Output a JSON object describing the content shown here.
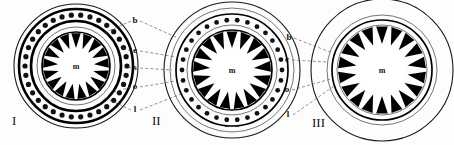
{
  "figure": {
    "background_color": "#fdfdfd",
    "ink_color": "#000000",
    "leader_color": "#4a4a52",
    "center_label": "m",
    "panels": [
      {
        "id": "panel-1",
        "roman": "I",
        "cx": 76,
        "cy": 66,
        "center_label": "m",
        "rings": [
          {
            "name": "b",
            "r": 62,
            "style": "thin"
          },
          {
            "name": "b-inner",
            "r": 57,
            "style": "fat"
          },
          {
            "name": "e",
            "r": 51,
            "style": "beaded"
          },
          {
            "name": "s",
            "r": 45,
            "style": "fat"
          },
          {
            "name": "o",
            "r": 39,
            "style": "hair"
          },
          {
            "name": "l",
            "r": 34,
            "style": "teeth"
          }
        ],
        "teeth_count": 17,
        "beads_count": 34
      },
      {
        "id": "panel-2",
        "roman": "II",
        "cx": 232,
        "cy": 70,
        "center_label": "m",
        "rings": [
          {
            "name": "b",
            "r": 68,
            "style": "thin"
          },
          {
            "name": "b-inner",
            "r": 62,
            "style": "hair"
          },
          {
            "name": "e",
            "r": 56,
            "style": "mid"
          },
          {
            "name": "s",
            "r": 50,
            "style": "beaded"
          },
          {
            "name": "o",
            "r": 45,
            "style": "hair"
          },
          {
            "name": "l",
            "r": 40,
            "style": "teeth"
          }
        ],
        "teeth_count": 17,
        "beads_count": 30
      },
      {
        "id": "panel-3",
        "roman": "III",
        "cx": 382,
        "cy": 70,
        "center_label": "m",
        "rings": [
          {
            "name": "b",
            "r": 71,
            "style": "thin"
          },
          {
            "name": "e",
            "r": 55,
            "style": "hair"
          },
          {
            "name": "o",
            "r": 50,
            "style": "mid"
          },
          {
            "name": "l",
            "r": 45,
            "style": "teeth"
          }
        ],
        "teeth_count": 18,
        "beads_count": 0
      }
    ],
    "layer_labels_center": [
      {
        "key": "b",
        "text": "b",
        "x": 135,
        "y": 23
      },
      {
        "key": "e",
        "text": "e",
        "x": 135,
        "y": 53
      },
      {
        "key": "s",
        "text": "s",
        "x": 135,
        "y": 70
      },
      {
        "key": "o",
        "text": "o",
        "x": 135,
        "y": 89
      },
      {
        "key": "l",
        "text": "l",
        "x": 135,
        "y": 112
      }
    ],
    "layer_labels_right": [
      {
        "key": "b",
        "text": "b",
        "x": 298,
        "y": 40
      },
      {
        "key": "e",
        "text": "e",
        "x": 296,
        "y": 62
      },
      {
        "key": "o",
        "text": "o",
        "x": 296,
        "y": 92
      },
      {
        "key": "l",
        "text": "l",
        "x": 297,
        "y": 117
      }
    ],
    "roman_numerals": [
      {
        "text": "I",
        "x": 12,
        "y": 125
      },
      {
        "text": "II",
        "x": 152,
        "y": 125
      },
      {
        "text": "III",
        "x": 312,
        "y": 127
      }
    ]
  }
}
